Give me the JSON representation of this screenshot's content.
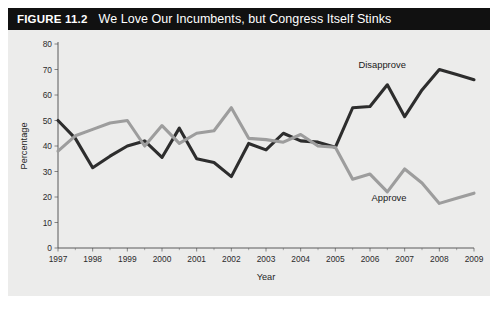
{
  "figure": {
    "number": "FIGURE 11.2",
    "title": "We Love Our Incumbents, but Congress Itself Stinks",
    "header_bg": "#111111",
    "header_text_color": "#ffffff",
    "panel_bg": "#ececeb"
  },
  "chart_data": {
    "type": "line",
    "title": "We Love Our Incumbents, but Congress Itself Stinks",
    "xlabel": "Year",
    "ylabel": "Percentage",
    "xlim": [
      1997,
      2009
    ],
    "ylim": [
      0,
      80
    ],
    "yticks": [
      0,
      10,
      20,
      30,
      40,
      50,
      60,
      70,
      80
    ],
    "ytick_labels": [
      "0",
      "10",
      "20",
      "30",
      "40",
      "50",
      "60",
      "70",
      "80"
    ],
    "xticks": [
      1997,
      1998,
      1999,
      2000,
      2001,
      2002,
      2003,
      2004,
      2005,
      2006,
      2007,
      2008,
      2009
    ],
    "xtick_labels": [
      "1997",
      "1998",
      "1999",
      "2000",
      "2001",
      "2002",
      "2003",
      "2004",
      "2005",
      "2006",
      "2007",
      "2008",
      "2009"
    ],
    "grid": false,
    "legend_position": "inline-annotation",
    "series": [
      {
        "name": "Disapprove",
        "color": "#2d2d2d",
        "label_x": 2006.35,
        "label_y": 70.5,
        "x": [
          1997,
          1997.5,
          1998,
          1998.5,
          1999,
          1999.5,
          2000,
          2000.5,
          2001,
          2001.5,
          2002,
          2002.5,
          2003,
          2003.5,
          2004,
          2004.5,
          2005,
          2005.5,
          2006,
          2006.5,
          2007,
          2007.5,
          2008,
          2008.5,
          2009
        ],
        "y": [
          50,
          43,
          31.5,
          36,
          40,
          42,
          35.5,
          47,
          35,
          33.5,
          28,
          41,
          38.5,
          45,
          42,
          41.5,
          39.5,
          55,
          55.5,
          64,
          51.5,
          62,
          70,
          68,
          66
        ]
      },
      {
        "name": "Approve",
        "color": "#9d9d9d",
        "label_x": 2006.55,
        "label_y": 18.5,
        "x": [
          1997,
          1997.5,
          1998,
          1998.5,
          1999,
          1999.5,
          2000,
          2000.5,
          2001,
          2001.5,
          2002,
          2002.5,
          2003,
          2003.5,
          2004,
          2004.5,
          2005,
          2005.5,
          2006,
          2006.5,
          2007,
          2007.5,
          2008,
          2008.5,
          2009
        ],
        "y": [
          38,
          44,
          46.5,
          49,
          50,
          40,
          48,
          41,
          45,
          46,
          55,
          43,
          42.5,
          41.5,
          44.5,
          40,
          39.5,
          27,
          29,
          22,
          31,
          25.5,
          17.5,
          19.5,
          21.5
        ]
      }
    ]
  }
}
